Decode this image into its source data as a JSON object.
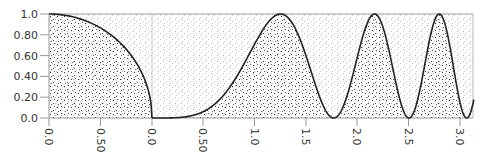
{
  "chart_data": [
    {
      "type": "line",
      "title": "",
      "xlabel": "",
      "ylabel": "",
      "description": "Quarter circle y = sqrt(1 - x^2) with stippled fill below and lighter stipple above",
      "x_ticks": [
        "0.0",
        "0.50",
        "0.0"
      ],
      "y_ticks": [
        "0.0",
        "0.20",
        "0.40",
        "0.60",
        "0.80",
        "1.0"
      ],
      "xlim": [
        0,
        1
      ],
      "ylim": [
        0,
        1
      ],
      "series": [
        {
          "name": "quarter-circle",
          "x": [
            0,
            0.2,
            0.4,
            0.6,
            0.8,
            0.9,
            0.95,
            1.0
          ],
          "y": [
            1.0,
            0.98,
            0.917,
            0.8,
            0.6,
            0.436,
            0.312,
            0.0
          ]
        }
      ],
      "grid": false
    },
    {
      "type": "line",
      "title": "",
      "xlabel": "",
      "ylabel": "",
      "description": "y = sin^2(x^2) with stippled fill below curve",
      "x_ticks": [
        "0.0",
        "0.50",
        "1.0",
        "1.5",
        "2.0",
        "2.5",
        "3.0"
      ],
      "xlim": [
        0,
        3.14
      ],
      "ylim": [
        0,
        1
      ],
      "series": [
        {
          "name": "sin2(x2)",
          "x": [
            0,
            0.5,
            1.0,
            1.25,
            1.5,
            1.77,
            2.0,
            2.17,
            2.3,
            2.51,
            2.7,
            2.8,
            2.9,
            3.07,
            3.14
          ],
          "y": [
            0,
            0.06,
            0.71,
            1.0,
            0.61,
            0.0,
            0.57,
            1.0,
            0.72,
            0.0,
            0.73,
            1.0,
            0.64,
            0.0,
            0.18
          ]
        }
      ],
      "grid": false
    }
  ],
  "axes": {
    "y_ticks": [
      "1.0",
      "0.80",
      "0.60",
      "0.40",
      "0.20",
      "0.0"
    ],
    "x_ticks": [
      "0.0",
      "0.50",
      "0.0",
      "0.50",
      "1.0",
      "1.5",
      "2.0",
      "2.5",
      "3.0"
    ]
  }
}
